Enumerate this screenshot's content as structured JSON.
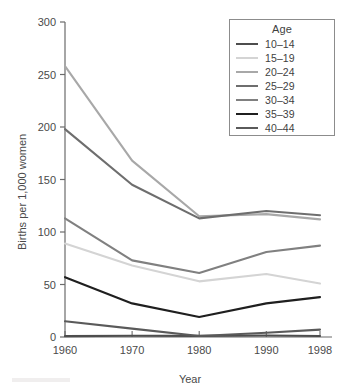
{
  "chart_data": {
    "type": "line",
    "title": "",
    "xlabel": "Year",
    "ylabel": "Births per 1,000 women",
    "x": [
      1960,
      1970,
      1980,
      1990,
      1998
    ],
    "categories": [
      "1960",
      "1970",
      "1980",
      "1990",
      "1998"
    ],
    "xlim": [
      1960,
      1998
    ],
    "ylim": [
      0,
      300
    ],
    "yticks": [
      0,
      50,
      100,
      150,
      200,
      250,
      300
    ],
    "ytick_labels": [
      "0",
      "50",
      "100",
      "150",
      "200",
      "250",
      "300"
    ],
    "xticks": [
      1960,
      1970,
      1980,
      1990,
      1998
    ],
    "xtick_labels": [
      "1960",
      "1970",
      "1980",
      "1990",
      "1998"
    ],
    "grid": false,
    "legend_position": "top-right",
    "legend_title": "Age",
    "series": [
      {
        "name": "10–14",
        "color": "#4d4d4d",
        "values": [
          0.8,
          1.2,
          1.1,
          1.4,
          1.0
        ]
      },
      {
        "name": "15–19",
        "color": "#d4d4d4",
        "values": [
          89,
          68,
          53,
          60,
          51
        ]
      },
      {
        "name": "20–24",
        "color": "#a8a8a8",
        "values": [
          258,
          168,
          115,
          117,
          112
        ]
      },
      {
        "name": "25–29",
        "color": "#6e6e6e",
        "values": [
          198,
          145,
          113,
          120,
          116
        ]
      },
      {
        "name": "30–34",
        "color": "#808080",
        "values": [
          113,
          73,
          61,
          81,
          87
        ]
      },
      {
        "name": "35–39",
        "color": "#1f1f1f",
        "values": [
          57,
          32,
          19,
          32,
          38
        ]
      },
      {
        "name": "40–44",
        "color": "#5a5a5a",
        "values": [
          15,
          8,
          1,
          4,
          7
        ]
      }
    ]
  },
  "legend": {
    "title": "Age",
    "items": [
      {
        "label": "10–14",
        "color": "#4d4d4d"
      },
      {
        "label": "15–19",
        "color": "#d4d4d4"
      },
      {
        "label": "20–24",
        "color": "#a8a8a8"
      },
      {
        "label": "25–29",
        "color": "#6e6e6e"
      },
      {
        "label": "30–34",
        "color": "#808080"
      },
      {
        "label": "35–39",
        "color": "#1f1f1f"
      },
      {
        "label": "40–44",
        "color": "#5a5a5a"
      }
    ]
  },
  "axes": {
    "y_title": "Births per 1,000 women",
    "x_title": "Year"
  },
  "colors": {
    "axis": "#6b6b6b",
    "text": "#3f3f3f",
    "background": "#ffffff"
  }
}
